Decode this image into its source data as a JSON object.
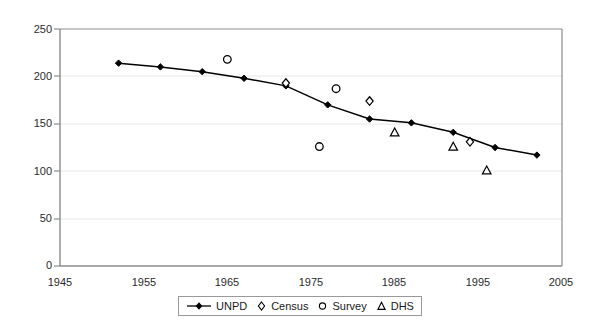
{
  "chart_data": {
    "type": "line",
    "title": "",
    "subtitle": "",
    "xlabel": "",
    "ylabel": "",
    "xlim": [
      1945,
      2005
    ],
    "ylim": [
      0,
      250
    ],
    "xticks": [
      1945,
      1955,
      1965,
      1975,
      1985,
      1995,
      2005
    ],
    "yticks": [
      0,
      50,
      100,
      150,
      200,
      250
    ],
    "grid": "horizontal",
    "legend_position": "bottom-center",
    "series": [
      {
        "name": "UNPD",
        "marker": "diamond-filled",
        "line": true,
        "color": "#000000",
        "points": [
          {
            "x": 1952,
            "y": 214
          },
          {
            "x": 1957,
            "y": 210
          },
          {
            "x": 1962,
            "y": 205
          },
          {
            "x": 1967,
            "y": 198
          },
          {
            "x": 1972,
            "y": 190
          },
          {
            "x": 1977,
            "y": 170
          },
          {
            "x": 1982,
            "y": 155
          },
          {
            "x": 1987,
            "y": 151
          },
          {
            "x": 1992,
            "y": 141
          },
          {
            "x": 1997,
            "y": 125
          },
          {
            "x": 2002,
            "y": 117
          }
        ]
      },
      {
        "name": "Census",
        "marker": "diamond-open",
        "line": false,
        "color": "#000000",
        "points": [
          {
            "x": 1972,
            "y": 193
          },
          {
            "x": 1982,
            "y": 174
          },
          {
            "x": 1994,
            "y": 131
          }
        ]
      },
      {
        "name": "Survey",
        "marker": "circle-open",
        "line": false,
        "color": "#000000",
        "points": [
          {
            "x": 1965,
            "y": 218
          },
          {
            "x": 1978,
            "y": 187
          },
          {
            "x": 1976,
            "y": 126
          }
        ]
      },
      {
        "name": "DHS",
        "marker": "triangle-open",
        "line": false,
        "color": "#000000",
        "points": [
          {
            "x": 1985,
            "y": 141
          },
          {
            "x": 1992,
            "y": 126
          },
          {
            "x": 1996,
            "y": 101
          }
        ]
      }
    ]
  },
  "axes": {
    "y_tick_labels": [
      "250",
      "200",
      "150",
      "100",
      "50",
      "0"
    ],
    "x_tick_labels": [
      "1945",
      "1955",
      "1965",
      "1975",
      "1985",
      "1995",
      "2005"
    ]
  },
  "legend": {
    "items": [
      {
        "label": "UNPD",
        "glyph": "line-diamond-marker-icon"
      },
      {
        "label": "Census",
        "glyph": "diamond-open-marker-icon"
      },
      {
        "label": "Survey",
        "glyph": "circle-open-marker-icon"
      },
      {
        "label": "DHS",
        "glyph": "triangle-open-marker-icon"
      }
    ]
  },
  "colors": {
    "axis": "#808080",
    "gridline": "#e2e2e2",
    "series": "#000000",
    "background": "#ffffff"
  }
}
